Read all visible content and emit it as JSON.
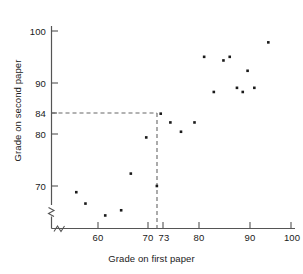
{
  "chart_data": {
    "type": "scatter",
    "title": "",
    "xlabel": "Grade on first paper",
    "ylabel": "Grade on second paper",
    "xlim": [
      52,
      100
    ],
    "ylim": [
      63,
      102
    ],
    "xticks": [
      60,
      70,
      73,
      80,
      90,
      100
    ],
    "xticklabels": [
      "60",
      "70",
      "73",
      "80",
      "90",
      "100"
    ],
    "yticks": [
      70,
      80,
      84,
      90,
      100
    ],
    "yticklabels": [
      "70",
      "80",
      "84",
      "90",
      "100"
    ],
    "grid": false,
    "legend": null,
    "axis_break_x": true,
    "axis_break_y": true,
    "marker_color": "#1a1a1a",
    "axis_color": "#555555",
    "annotation_color": "#666666",
    "annotations": [
      {
        "type": "dashed-guides",
        "x": 73,
        "y": 84,
        "label": "",
        "description": "dashed horizontal line at y=84 and dashed vertical line at x=73 meeting at the point (73, 84)"
      }
    ],
    "points": [
      {
        "x": 55.5,
        "y": 68.8
      },
      {
        "x": 57.4,
        "y": 66.6
      },
      {
        "x": 61.5,
        "y": 64.3
      },
      {
        "x": 64.8,
        "y": 65.3
      },
      {
        "x": 66.8,
        "y": 72.4
      },
      {
        "x": 70.0,
        "y": 79.4
      },
      {
        "x": 72.2,
        "y": 70.0
      },
      {
        "x": 73.0,
        "y": 84.0
      },
      {
        "x": 75.0,
        "y": 82.3
      },
      {
        "x": 77.2,
        "y": 80.5
      },
      {
        "x": 80.0,
        "y": 82.3
      },
      {
        "x": 82.0,
        "y": 95.0
      },
      {
        "x": 84.0,
        "y": 88.2
      },
      {
        "x": 86.0,
        "y": 94.3
      },
      {
        "x": 87.3,
        "y": 95.0
      },
      {
        "x": 88.8,
        "y": 89.0
      },
      {
        "x": 90.0,
        "y": 88.2
      },
      {
        "x": 91.0,
        "y": 92.3
      },
      {
        "x": 92.4,
        "y": 89.0
      },
      {
        "x": 95.3,
        "y": 97.8
      }
    ]
  },
  "axes": {
    "x_title": "Grade on first paper",
    "y_title": "Grade on second paper"
  }
}
